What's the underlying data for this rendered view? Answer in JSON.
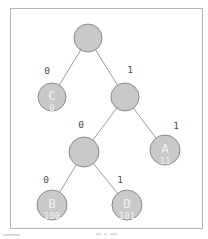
{
  "figure": {
    "type": "binary-tree-diagram",
    "colors": {
      "background": "#ffffff",
      "frame_border": "#b5b5b5",
      "node_fill": "#c9c9c9",
      "node_border": "#8c8c8c",
      "node_text": "#f2f2f2",
      "edge_line": "#9a9a9a",
      "edge_label_text": "#4a4a4a"
    },
    "nodes": {
      "root": {
        "label": ""
      },
      "internal_right": {
        "label": ""
      },
      "internal_mid": {
        "label": ""
      },
      "c": {
        "label": "C",
        "code": "0"
      },
      "a": {
        "label": "A",
        "code": "11"
      },
      "b": {
        "label": "B",
        "code": "100"
      },
      "d": {
        "label": "D",
        "code": "101"
      }
    },
    "edge_labels": {
      "root_to_c": "0",
      "root_to_internal_right": "1",
      "internal_right_to_internal_mid": "0",
      "internal_right_to_a": "1",
      "internal_mid_to_b": "0",
      "internal_mid_to_d": "1"
    }
  }
}
